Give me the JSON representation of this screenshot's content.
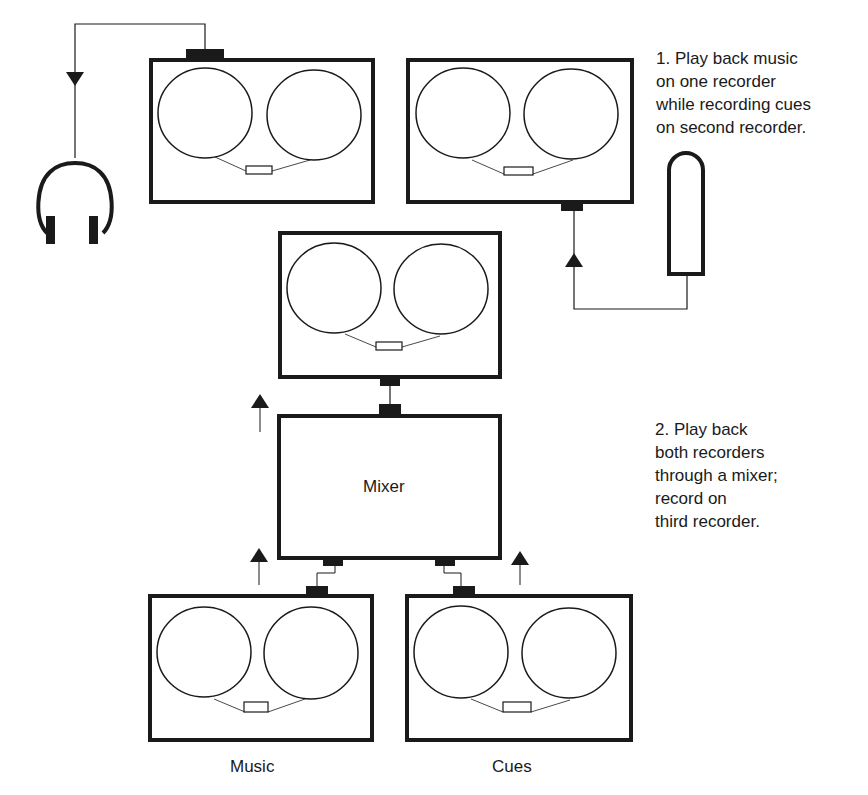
{
  "diagram": {
    "step1": {
      "lines": [
        "1.  Play back music",
        "on one recorder",
        "while recording cues",
        "on second recorder."
      ]
    },
    "step2": {
      "lines": [
        "2.  Play back",
        "both recorders",
        "through a mixer;",
        "record on",
        "third recorder."
      ]
    },
    "labels": {
      "mixer": "Mixer",
      "music": "Music",
      "cues": "Cues"
    },
    "nodes": [
      {
        "id": "recorder-playback-top-left",
        "type": "tape-recorder"
      },
      {
        "id": "recorder-record-top-right",
        "type": "tape-recorder"
      },
      {
        "id": "headphones",
        "type": "headphones"
      },
      {
        "id": "microphone",
        "type": "microphone"
      },
      {
        "id": "recorder-master",
        "type": "tape-recorder"
      },
      {
        "id": "mixer",
        "type": "mixer"
      },
      {
        "id": "recorder-music",
        "type": "tape-recorder"
      },
      {
        "id": "recorder-cues",
        "type": "tape-recorder"
      }
    ],
    "colors": {
      "ink": "#1a1a1a",
      "background": "#ffffff"
    }
  }
}
